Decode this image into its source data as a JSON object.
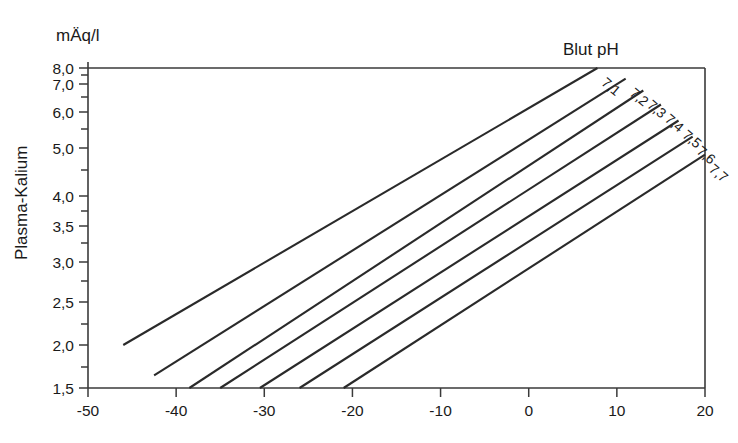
{
  "figure": {
    "unit_label": "mÄq/l",
    "y_axis_title": "Plasma-Kalium",
    "plot_title": "Blut pH",
    "background_color": "#ffffff",
    "line_color": "#2a2a2a",
    "axis_color": "#3a3a3a"
  },
  "chart_data": {
    "type": "line",
    "title": "Blut pH",
    "xlabel": "",
    "ylabel": "Plasma-Kalium",
    "unit": "mÄq/l",
    "grid": false,
    "legend_position": "inline-right",
    "xlim": [
      -50,
      20
    ],
    "ylim": [
      1.5,
      8.0
    ],
    "x_ticks": [
      -50,
      -40,
      -30,
      -20,
      -10,
      0,
      10,
      20
    ],
    "x_tick_labels": [
      "-50",
      "-40",
      "-30",
      "-20",
      "-10",
      "0",
      "10",
      "20"
    ],
    "y_ticks": [
      1.5,
      2.0,
      2.5,
      3.0,
      3.5,
      4.0,
      5.0,
      6.0,
      7.0,
      8.0
    ],
    "y_tick_labels": [
      "1,5",
      "2,0",
      "2,5",
      "3,0",
      "3,5",
      "4,0",
      "5,0",
      "6,0",
      "7,0",
      "8,0"
    ],
    "y_minor_ticks": [
      1.75,
      2.25,
      2.75,
      3.25,
      3.75,
      4.5,
      5.5,
      6.5,
      7.5
    ],
    "y_scale": "nonlinear-log-like",
    "series": [
      {
        "name": "7,1",
        "label": "7,1",
        "x": [
          -46.0,
          7.8
        ],
        "y": [
          2.0,
          8.0
        ]
      },
      {
        "name": "7,2",
        "label": "7,2",
        "x": [
          -42.5,
          11.0
        ],
        "y": [
          1.65,
          7.3
        ]
      },
      {
        "name": "7,3",
        "label": "7,3",
        "x": [
          -38.5,
          13.0
        ],
        "y": [
          1.5,
          6.75
        ]
      },
      {
        "name": "7,4",
        "label": "7,4",
        "x": [
          -35.0,
          15.0
        ],
        "y": [
          1.5,
          6.25
        ]
      },
      {
        "name": "7,5",
        "label": "7,5",
        "x": [
          -30.5,
          17.0
        ],
        "y": [
          1.5,
          5.75
        ]
      },
      {
        "name": "7,6",
        "label": "7,6",
        "x": [
          -26.0,
          18.6
        ],
        "y": [
          1.5,
          5.3
        ]
      },
      {
        "name": "7,7",
        "label": "7,7",
        "x": [
          -21.0,
          20.0
        ],
        "y": [
          1.5,
          4.85
        ]
      }
    ]
  }
}
